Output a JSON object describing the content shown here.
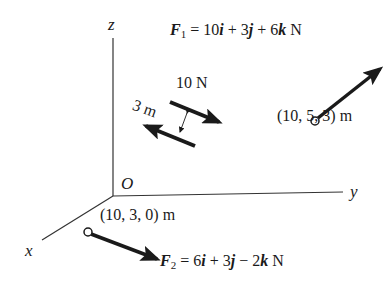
{
  "axes": {
    "z_label": "z",
    "y_label": "y",
    "x_label": "x",
    "origin_label": "O"
  },
  "force1": {
    "symbol": "F",
    "subscript": "1",
    "expression_prefix": " = 10",
    "i": "i",
    "plus1": " + 3",
    "j": "j",
    "plus2": " + 6",
    "k": "k",
    "unit": " N",
    "full_text": "F1 = 10i + 3j + 6k N",
    "point_label": "(10, 5, 3) m"
  },
  "force2": {
    "symbol": "F",
    "subscript": "2",
    "expression_prefix": " = 6",
    "i": "i",
    "plus1": " + 3",
    "j": "j",
    "minus": " − 2",
    "k": "k",
    "unit": " N",
    "full_text": "F2 = 6i + 3j − 2k N",
    "point_label": "(10, 3, 0) m"
  },
  "couple": {
    "force_label": "10 N",
    "distance_label": "3 m"
  },
  "colors": {
    "ink": "#1a1a1a",
    "background": "#ffffff"
  }
}
